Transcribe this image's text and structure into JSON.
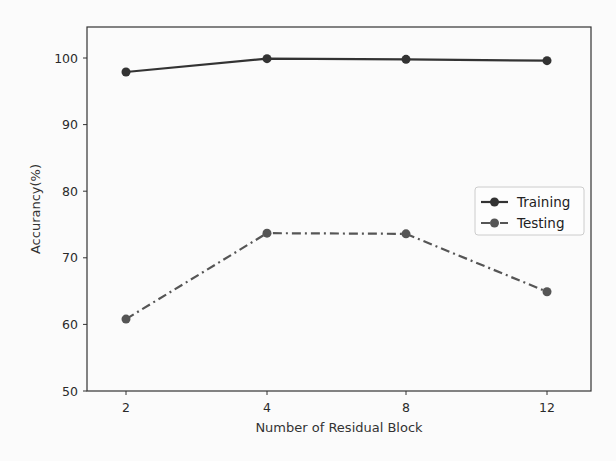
{
  "chart_data": {
    "type": "line",
    "title": "",
    "xlabel": "Number of Residual Block",
    "ylabel": "Accurancy(%)",
    "categories": [
      "2",
      "4",
      "8",
      "12"
    ],
    "ylim": [
      50,
      105
    ],
    "yticks": [
      50,
      60,
      70,
      80,
      90,
      100
    ],
    "grid": false,
    "legend_position": "center right",
    "series": [
      {
        "name": "Training",
        "values": [
          97.9,
          99.9,
          99.8,
          99.6
        ],
        "style": "solid",
        "marker": "circle",
        "color": "#333333"
      },
      {
        "name": "Testing",
        "values": [
          60.8,
          73.7,
          73.6,
          64.9
        ],
        "style": "dashdot",
        "marker": "circle",
        "color": "#555555"
      }
    ]
  }
}
